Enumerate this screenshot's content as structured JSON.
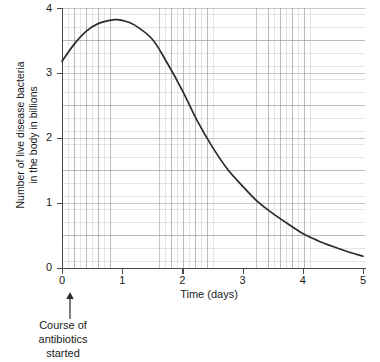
{
  "chart_data": {
    "type": "line",
    "title": "",
    "xlabel": "Time (days)",
    "ylabel": "Number of live disease bacteria in the body in billions",
    "ylabel_line1": "Number of live disease bacteria",
    "ylabel_line2": "in the body in billions",
    "xlim": [
      0,
      5
    ],
    "ylim": [
      0,
      4
    ],
    "xticks": [
      "0",
      "1",
      "2",
      "3",
      "4",
      "5"
    ],
    "yticks": [
      "0",
      "1",
      "2",
      "3",
      "4"
    ],
    "xtick_values": [
      0,
      1,
      2,
      3,
      4,
      5
    ],
    "ytick_values": [
      0,
      1,
      2,
      3,
      4
    ],
    "grid": true,
    "grid_minor_x": 0.1,
    "grid_minor_y": 0.1,
    "grid_major_x": 0.2,
    "grid_major_y": 0.5,
    "legend": "none",
    "series": [
      {
        "name": "Live disease bacteria in the body",
        "x": [
          0,
          0.2,
          0.4,
          0.6,
          0.87,
          1.0,
          1.2,
          1.5,
          1.75,
          2.0,
          2.25,
          2.5,
          2.75,
          3.0,
          3.25,
          3.5,
          3.75,
          4.0,
          4.25,
          4.5,
          4.75,
          5.0
        ],
        "y": [
          3.18,
          3.44,
          3.64,
          3.76,
          3.82,
          3.81,
          3.74,
          3.52,
          3.15,
          2.73,
          2.26,
          1.86,
          1.52,
          1.26,
          1.02,
          0.84,
          0.68,
          0.53,
          0.42,
          0.33,
          0.25,
          0.18
        ]
      }
    ],
    "annotations": [
      {
        "name": "course-of-antibiotics-marker",
        "x": 0,
        "arrow": "up",
        "lines": [
          "Course of",
          "antibiotics",
          "started"
        ]
      }
    ],
    "colors": {
      "curve": "#2b2b2b",
      "axis": "#4a4a4a",
      "grid_major": "#9a9aa4",
      "grid_minor": "#b4b4be",
      "text": "#1a1a1a",
      "background": "#ffffff"
    }
  }
}
